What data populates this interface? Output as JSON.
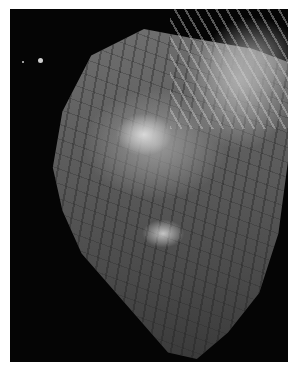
{
  "image": {
    "subject": "photograph of anatomical heart specimen on black background",
    "tone": "grayscale",
    "border_color": "#ffffff",
    "background_color": "#050505"
  }
}
